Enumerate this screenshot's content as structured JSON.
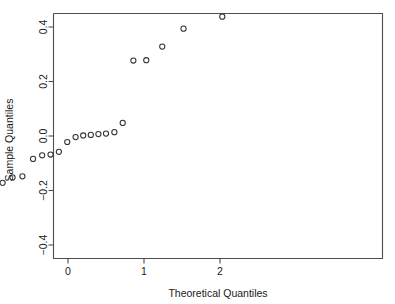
{
  "chart_data": {
    "type": "scatter",
    "title": "",
    "subtitle": "",
    "xlabel": "Theoretical Quantiles",
    "ylabel": "Sample Quantiles",
    "xlim": [
      -2.18,
      2.13
    ],
    "ylim": [
      -0.44,
      0.47
    ],
    "xticks": [
      -2,
      -1,
      0,
      1,
      2
    ],
    "xticklabels": [
      "−2",
      "−1",
      "0",
      "1",
      "2"
    ],
    "yticks": [
      -0.4,
      -0.2,
      0.0,
      0.2,
      0.4
    ],
    "yticklabels": [
      "−0.4",
      "−0.2",
      "0.0",
      "0.2",
      "0.4"
    ],
    "grid": false,
    "legend": false,
    "legend_position": "none",
    "marker": "open-circle",
    "marker_color": "#333333",
    "background_color": "#ffffff",
    "frame_color": "#4d4d4d",
    "series": [
      {
        "name": "sample quantiles",
        "x": [
          -2.03,
          -1.52,
          -1.22,
          -1.0,
          -0.86,
          -0.73,
          -0.6,
          -0.46,
          -0.34,
          -0.23,
          -0.12,
          -0.01,
          0.1,
          0.2,
          0.3,
          0.4,
          0.5,
          0.61,
          0.72,
          0.86,
          1.03,
          1.24,
          1.52,
          2.03
        ],
        "y": [
          -0.401,
          -0.25,
          -0.18,
          -0.175,
          -0.172,
          -0.152,
          -0.148,
          -0.084,
          -0.071,
          -0.068,
          -0.058,
          -0.022,
          -0.004,
          0.002,
          0.004,
          0.007,
          0.009,
          0.014,
          0.048,
          0.277,
          0.278,
          0.328,
          0.394,
          0.438
        ]
      }
    ]
  },
  "axes": {
    "x_axis_name": "theoretical-quantiles-axis",
    "y_axis_name": "sample-quantiles-axis"
  }
}
